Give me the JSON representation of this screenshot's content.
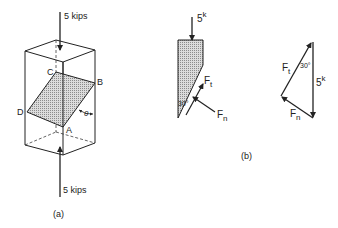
{
  "figure_a": {
    "caption": "(a)",
    "top_load": "5 kips",
    "bottom_load": "5 kips",
    "points": {
      "A": "A",
      "B": "B",
      "C": "C",
      "D": "D"
    },
    "angle": "θ"
  },
  "figure_b": {
    "caption": "(b)",
    "free_body": {
      "load_value": "5",
      "load_unit": "k",
      "angle": "30°",
      "tangential_force": {
        "base": "F",
        "sub": "t"
      },
      "normal_force": {
        "base": "F",
        "sub": "n"
      }
    },
    "force_triangle": {
      "load_value": "5",
      "load_unit": "k",
      "angle": "30°",
      "tangential_force": {
        "base": "F",
        "sub": "t"
      },
      "normal_force": {
        "base": "F",
        "sub": "n"
      }
    }
  },
  "colors": {
    "line": "#222222",
    "hatch": "#bdbdbd"
  }
}
